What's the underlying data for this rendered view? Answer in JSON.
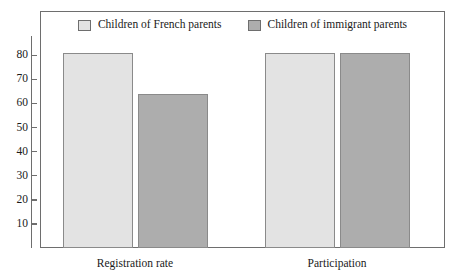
{
  "chart_data": {
    "type": "bar",
    "title": "",
    "subtitle": "",
    "xlabel": "",
    "ylabel": "",
    "categories": [
      "Registration rate",
      "Participation"
    ],
    "series": [
      {
        "name": "Children of French parents",
        "color": "#e3e3e3",
        "values": [
          81,
          81
        ]
      },
      {
        "name": "Children of immigrant parents",
        "color": "#adadad",
        "values": [
          64,
          81
        ]
      }
    ],
    "ylim": [
      0,
      88
    ],
    "yticks": [
      10,
      20,
      30,
      40,
      50,
      60,
      70,
      80
    ],
    "ytick_labels": [
      "10",
      "20",
      "30",
      "40",
      "50",
      "60",
      "70",
      "80"
    ],
    "grid": false,
    "legend_position": "top-center",
    "frame": true,
    "annotations": []
  },
  "legend": {
    "entries": [
      {
        "label": "Children of French parents",
        "swatch_name": "legend-swatch-french"
      },
      {
        "label": "Children of immigrant parents",
        "swatch_name": "legend-swatch-immigrant"
      }
    ]
  },
  "axis": {
    "y_tick_labels": [
      "80",
      "70",
      "60",
      "50",
      "40",
      "30",
      "20",
      "10"
    ],
    "x_tick_labels": [
      "Registration rate",
      "Participation"
    ]
  }
}
